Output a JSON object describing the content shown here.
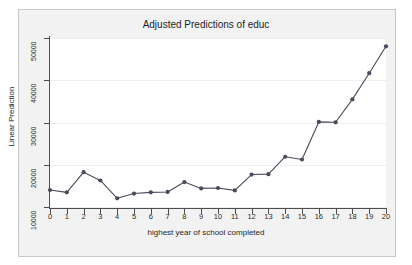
{
  "chart_data": {
    "type": "line",
    "title": "Adjusted Predictions of educ",
    "xlabel": "highest year of school completed",
    "ylabel": "Linear Prediction",
    "x": [
      0,
      1,
      2,
      3,
      4,
      5,
      6,
      7,
      8,
      9,
      10,
      11,
      12,
      13,
      14,
      15,
      16,
      17,
      18,
      19,
      20
    ],
    "values": [
      12800,
      12200,
      17300,
      15200,
      10700,
      11900,
      12200,
      12300,
      14800,
      13200,
      13300,
      12700,
      16700,
      16800,
      21200,
      20500,
      30000,
      29900,
      35700,
      42300,
      49100
    ],
    "categories": [
      "0",
      "1",
      "2",
      "3",
      "4",
      "5",
      "6",
      "7",
      "8",
      "9",
      "10",
      "11",
      "12",
      "13",
      "14",
      "15",
      "16",
      "17",
      "18",
      "19",
      "20"
    ],
    "xlim": [
      0,
      20
    ],
    "ylim": [
      8500,
      51200
    ],
    "yticks": [
      10000,
      20000,
      30000,
      40000,
      50000
    ],
    "ytick_labels": [
      "10000",
      "20000",
      "30000",
      "40000",
      "50000"
    ],
    "xticks": [
      0,
      1,
      2,
      3,
      4,
      5,
      6,
      7,
      8,
      9,
      10,
      11,
      12,
      13,
      14,
      15,
      16,
      17,
      18,
      19,
      20
    ],
    "grid": true,
    "grid_axis": "y",
    "legend": false,
    "series_color": "#4a4a5a",
    "marker": "circle",
    "background_color": "#f2f2f2",
    "plot_background_color": "#ffffff",
    "grid_color": "#eceff1",
    "axis_color": "#4d4d4d"
  }
}
